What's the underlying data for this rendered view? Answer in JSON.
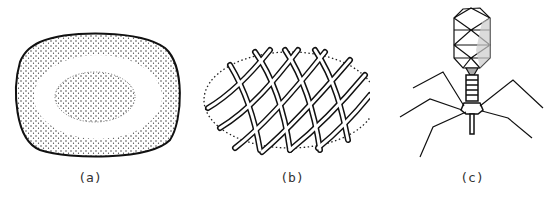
{
  "figure": {
    "panels": [
      {
        "id": "a",
        "label": "(a)",
        "description": "spherical/oval particle with dotted outer shell and dotted inner core"
      },
      {
        "id": "b",
        "label": "(b)",
        "description": "helical nucleocapsid coiled inside dotted envelope outline"
      },
      {
        "id": "c",
        "label": "(c)",
        "description": "bacteriophage with icosahedral head, contractile sheath tail, base plate and tail fibers"
      }
    ]
  }
}
